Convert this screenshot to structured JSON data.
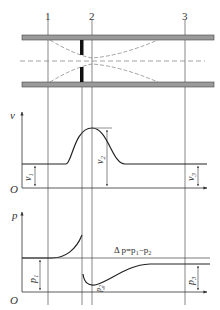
{
  "diagram": {
    "sections": [
      {
        "label": "1",
        "x": 48
      },
      {
        "label": "2",
        "x": 92
      },
      {
        "label": "3",
        "x": 185
      }
    ],
    "velocity_plot": {
      "axis_label": "v",
      "origin_label": "O",
      "labels": {
        "v1": "v",
        "v1_sub": "1",
        "v2": "v",
        "v2_sub": "2",
        "v3": "v",
        "v3_sub": "3"
      }
    },
    "pressure_plot": {
      "axis_label": "p",
      "origin_label": "O",
      "labels": {
        "p1": "p",
        "p1_sub": "1",
        "p2": "p",
        "p2_sub": "2",
        "p3": "p",
        "p3_sub": "3"
      },
      "delta_label": "Δ p=p",
      "delta_sub1": "1",
      "delta_mid": "−p",
      "delta_sub2": "2"
    },
    "colors": {
      "line": "#2a2a2a",
      "pipe_fill": "#9a9a9a",
      "plate": "#111111",
      "grid": "#555555"
    }
  }
}
